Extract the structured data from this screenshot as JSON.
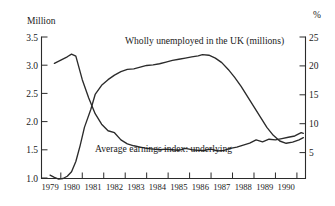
{
  "chart_data": {
    "type": "line",
    "title": "",
    "xlabel": "",
    "ylabel": "Million",
    "ylabel_right": "%",
    "grid": false,
    "legend": "annotations-inline",
    "x_tick_labels": [
      "1979",
      "1980",
      "1981",
      "1982",
      "1983",
      "1984",
      "1985",
      "1986",
      "1987",
      "1988",
      "1989",
      "1990"
    ],
    "xlim": [
      1978.6,
      1990.9
    ],
    "left_axis": {
      "label": "Million",
      "ticks": [
        "3.5",
        "3.0",
        "2.5",
        "2.0",
        "1.5",
        "1.0"
      ],
      "tick_values": [
        3.5,
        3.0,
        2.5,
        2.0,
        1.5,
        1.0
      ],
      "ylim": [
        1.0,
        3.5
      ]
    },
    "right_axis": {
      "label": "%",
      "ticks": [
        "25",
        "20",
        "15",
        "10",
        "5"
      ],
      "tick_values": [
        25,
        20,
        15,
        10,
        5
      ],
      "ylim": [
        3.3,
        25
      ]
    },
    "annotations": [
      {
        "text": "Wholly unemployed in the UK (millions)",
        "x": 1983.6,
        "y_left": 3.22
      },
      {
        "text": "Average earnings index:  underlying",
        "x": 1983.1,
        "y_left": 1.52
      }
    ],
    "series": [
      {
        "name": "Wholly unemployed in the UK (millions)",
        "axis": "left",
        "unit": "millions",
        "x": [
          1979.0,
          1979.2,
          1979.4,
          1979.6,
          1979.8,
          1980.0,
          1980.2,
          1980.4,
          1980.6,
          1980.9,
          1981.1,
          1981.4,
          1981.7,
          1982.0,
          1982.3,
          1982.6,
          1982.9,
          1983.2,
          1983.5,
          1983.8,
          1984.1,
          1984.4,
          1984.7,
          1985.0,
          1985.3,
          1985.6,
          1985.9,
          1986.1,
          1986.4,
          1986.7,
          1987.0,
          1987.3,
          1987.6,
          1987.9,
          1988.2,
          1988.5,
          1988.8,
          1989.1,
          1989.4,
          1989.7,
          1990.0,
          1990.3,
          1990.6,
          1990.8
        ],
        "values": [
          1.06,
          1.02,
          0.99,
          1.0,
          1.04,
          1.12,
          1.3,
          1.58,
          1.9,
          2.22,
          2.48,
          2.64,
          2.74,
          2.82,
          2.88,
          2.92,
          2.93,
          2.96,
          2.99,
          3.0,
          3.02,
          3.05,
          3.08,
          3.1,
          3.12,
          3.14,
          3.16,
          3.18,
          3.17,
          3.12,
          3.04,
          2.92,
          2.78,
          2.62,
          2.44,
          2.26,
          2.08,
          1.9,
          1.76,
          1.66,
          1.62,
          1.64,
          1.68,
          1.72
        ]
      },
      {
        "name": "Average earnings index:  underlying",
        "axis": "right",
        "unit": "percent",
        "x": [
          1979.2,
          1979.5,
          1979.8,
          1980.0,
          1980.2,
          1980.5,
          1980.8,
          1981.1,
          1981.4,
          1981.7,
          1982.0,
          1982.3,
          1982.6,
          1982.9,
          1983.2,
          1983.5,
          1983.8,
          1984.1,
          1984.4,
          1984.7,
          1985.0,
          1985.3,
          1985.6,
          1985.9,
          1986.2,
          1986.5,
          1986.8,
          1987.1,
          1987.4,
          1987.7,
          1988.0,
          1988.3,
          1988.6,
          1988.9,
          1989.2,
          1989.5,
          1989.8,
          1990.1,
          1990.4,
          1990.7,
          1990.8
        ],
        "values": [
          20.9,
          21.4,
          21.9,
          22.3,
          22.0,
          18.4,
          15.6,
          13.2,
          11.6,
          10.6,
          10.3,
          9.2,
          8.6,
          8.3,
          8.1,
          7.9,
          7.8,
          7.7,
          7.8,
          7.7,
          7.6,
          7.9,
          7.7,
          7.6,
          7.6,
          7.8,
          7.5,
          7.6,
          7.9,
          8.1,
          8.4,
          8.7,
          9.2,
          8.9,
          9.3,
          9.2,
          9.4,
          9.6,
          9.8,
          10.3,
          10.2
        ]
      }
    ]
  }
}
